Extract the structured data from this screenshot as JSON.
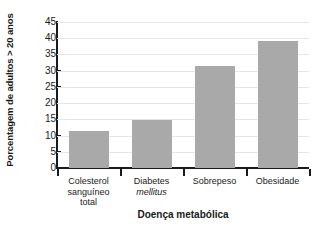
{
  "chart_data": {
    "type": "bar",
    "title": "",
    "categories": [
      "Colesterol sanguíneo total",
      "Diabetes mellitus",
      "Sobrepeso",
      "Obesidade"
    ],
    "category_lines": [
      [
        "Colesterol",
        "sanguíneo",
        "total"
      ],
      [
        "Diabetes",
        "mellitus"
      ],
      [
        "Sobrepeso"
      ],
      [
        "Obesidade"
      ]
    ],
    "category_italic_lines": [
      [],
      [
        "mellitus"
      ],
      [],
      []
    ],
    "values": [
      11.5,
      14.8,
      31.3,
      39.3
    ],
    "xlabel": "Doença metabólica",
    "ylabel": "Porcentagem de adultos > 20 anos",
    "ylim": [
      0,
      45
    ],
    "yticks": [
      0,
      5,
      10,
      15,
      20,
      25,
      30,
      35,
      40,
      45
    ],
    "ytick_labels": [
      "0",
      "5",
      "10",
      "15",
      "20",
      "25",
      "30",
      "35",
      "40",
      "45"
    ],
    "grid": true,
    "grid_axis": "y",
    "legend": false,
    "bar_color": "#a9a9a9",
    "grid_color": "#e6e6e6",
    "axis_color": "#1a1a1a"
  }
}
